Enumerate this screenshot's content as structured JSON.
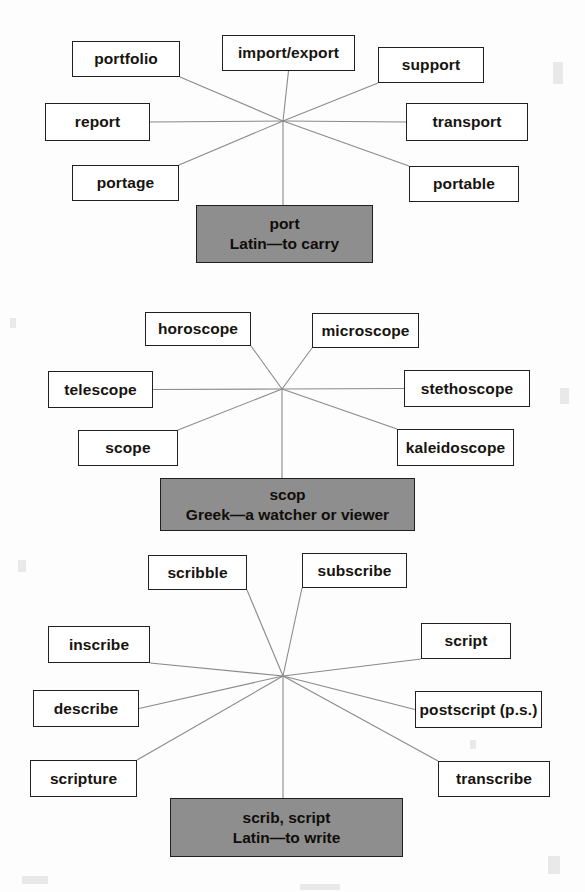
{
  "page": {
    "background_color": "#fdfdfd",
    "box_fill": "#ffffff",
    "box_border": "#231f20",
    "root_fill": "#8e8e8e",
    "line_color": "#8a8a8a"
  },
  "webs": [
    {
      "id": "port-web",
      "root": {
        "word": "port",
        "origin": "Latin—to carry",
        "x": 196,
        "y": 205,
        "w": 177,
        "h": 58
      },
      "hub": {
        "x": 283,
        "y": 121
      },
      "nodes": [
        {
          "label": "portfolio",
          "x": 72,
          "y": 41,
          "w": 108,
          "h": 36,
          "anchor": "br"
        },
        {
          "label": "import/export",
          "x": 222,
          "y": 35,
          "w": 133,
          "h": 36,
          "anchor": "bc"
        },
        {
          "label": "support",
          "x": 378,
          "y": 47,
          "w": 106,
          "h": 36,
          "anchor": "bl"
        },
        {
          "label": "report",
          "x": 45,
          "y": 103,
          "w": 105,
          "h": 38,
          "anchor": "r"
        },
        {
          "label": "transport",
          "x": 406,
          "y": 103,
          "w": 122,
          "h": 38,
          "anchor": "l"
        },
        {
          "label": "portage",
          "x": 72,
          "y": 165,
          "w": 107,
          "h": 36,
          "anchor": "tr"
        },
        {
          "label": "portable",
          "x": 409,
          "y": 166,
          "w": 110,
          "h": 36,
          "anchor": "tl"
        }
      ]
    },
    {
      "id": "scop-web",
      "root": {
        "word": "scop",
        "origin": "Greek—a watcher or viewer",
        "x": 160,
        "y": 478,
        "w": 255,
        "h": 53
      },
      "hub": {
        "x": 282,
        "y": 389
      },
      "nodes": [
        {
          "label": "horoscope",
          "x": 145,
          "y": 312,
          "w": 106,
          "h": 34,
          "anchor": "br"
        },
        {
          "label": "microscope",
          "x": 312,
          "y": 313,
          "w": 107,
          "h": 35,
          "anchor": "bl"
        },
        {
          "label": "telescope",
          "x": 48,
          "y": 371,
          "w": 105,
          "h": 37,
          "anchor": "r"
        },
        {
          "label": "stethoscope",
          "x": 404,
          "y": 370,
          "w": 126,
          "h": 37,
          "anchor": "l"
        },
        {
          "label": "scope",
          "x": 78,
          "y": 430,
          "w": 100,
          "h": 36,
          "anchor": "tr"
        },
        {
          "label": "kaleidoscope",
          "x": 397,
          "y": 429,
          "w": 117,
          "h": 37,
          "anchor": "tl"
        }
      ]
    },
    {
      "id": "scrib-web",
      "root": {
        "word": "scrib, script",
        "origin": "Latin—to write",
        "x": 170,
        "y": 798,
        "w": 233,
        "h": 59
      },
      "hub": {
        "x": 283,
        "y": 676
      },
      "nodes": [
        {
          "label": "scribble",
          "x": 148,
          "y": 555,
          "w": 99,
          "h": 35,
          "anchor": "br"
        },
        {
          "label": "subscribe",
          "x": 302,
          "y": 553,
          "w": 105,
          "h": 35,
          "anchor": "bl"
        },
        {
          "label": "inscribe",
          "x": 48,
          "y": 626,
          "w": 102,
          "h": 37,
          "anchor": "br"
        },
        {
          "label": "script",
          "x": 421,
          "y": 623,
          "w": 90,
          "h": 36,
          "anchor": "bl"
        },
        {
          "label": "describe",
          "x": 33,
          "y": 690,
          "w": 106,
          "h": 37,
          "anchor": "r"
        },
        {
          "label": "postscript (p.s.)",
          "x": 415,
          "y": 691,
          "w": 127,
          "h": 37,
          "anchor": "l"
        },
        {
          "label": "scripture",
          "x": 30,
          "y": 760,
          "w": 107,
          "h": 37,
          "anchor": "tr"
        },
        {
          "label": "transcribe",
          "x": 438,
          "y": 761,
          "w": 112,
          "h": 36,
          "anchor": "tl"
        }
      ]
    }
  ]
}
